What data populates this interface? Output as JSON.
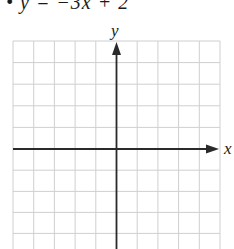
{
  "problem": {
    "equation": "• y = −3x + 2"
  },
  "graph": {
    "x_axis_label": "x",
    "y_axis_label": "y",
    "grid_color": "#c8c8c8",
    "axis_color": "#2a2a2a",
    "grid": {
      "columns": 10,
      "rows_visible": 10,
      "cell_size_px": 20.7
    }
  }
}
